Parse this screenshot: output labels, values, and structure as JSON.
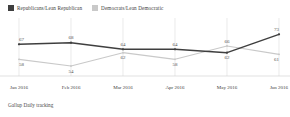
{
  "legend": {
    "items": [
      {
        "label": "Republicans/Lean Republican",
        "color": "#3f3f3f",
        "icon": "square-swatch"
      },
      {
        "label": "Democrats/Lean Democratic",
        "color": "#c9c9c9",
        "icon": "square-swatch"
      }
    ]
  },
  "footer": {
    "source": "Gallup Daily tracking"
  },
  "chart_data": {
    "type": "line",
    "title": "",
    "xlabel": "",
    "ylabel": "",
    "categories": [
      "Jan 2016",
      "Feb 2016",
      "Mar 2016",
      "Apr 2016",
      "May 2016",
      "Jun 2016"
    ],
    "ylim": [
      48,
      78
    ],
    "grid": "vertical",
    "legend_position": "top-left",
    "series": [
      {
        "name": "Republicans/Lean Republican",
        "color": "#3f3f3f",
        "values": [
          67,
          68,
          64,
          64,
          62,
          73
        ],
        "labels": [
          "67",
          "68",
          "64",
          "64",
          "62",
          "73"
        ],
        "label_positions": [
          "above",
          "above",
          "above",
          "above",
          "below",
          "above"
        ]
      },
      {
        "name": "Democrats/Lean Democratic",
        "color": "#c9c9c9",
        "values": [
          58,
          54,
          62,
          58,
          66,
          61
        ],
        "labels": [
          "58",
          "54",
          "62",
          "58",
          "66",
          "61"
        ],
        "label_positions": [
          "below",
          "below",
          "below",
          "below",
          "above",
          "below"
        ]
      }
    ]
  }
}
